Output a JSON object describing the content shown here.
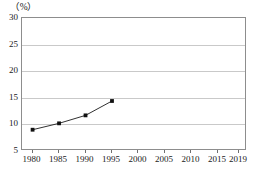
{
  "chart_data": {
    "type": "line",
    "title": "",
    "subtitle": "",
    "xlabel": "",
    "ylabel": "",
    "unit_label": "（%）",
    "x": [
      1980,
      1985,
      1990,
      1995
    ],
    "values": [
      9.0,
      10.2,
      11.7,
      14.4
    ],
    "series": [
      {
        "name": "",
        "x": [
          1980,
          1985,
          1990,
          1995
        ],
        "values": [
          9.0,
          10.2,
          11.7,
          14.4
        ],
        "marker": "square",
        "color": "#111111"
      }
    ],
    "xlim": [
      1978,
      2020.5
    ],
    "ylim": [
      5,
      30
    ],
    "y_ticks": [
      30,
      25,
      20,
      15,
      10,
      5
    ],
    "y_tick_labels": [
      "30",
      "25",
      "20",
      "15",
      "10",
      "5"
    ],
    "x_ticks": [
      1980,
      1985,
      1990,
      1995,
      2000,
      2005,
      2010,
      2015,
      2019
    ],
    "x_tick_labels": [
      "1980",
      "1985",
      "1990",
      "1995",
      "2000",
      "2005",
      "2010",
      "2015",
      "2019"
    ],
    "grid": true,
    "grid_axis": "y",
    "grid_color": "#c9c9c9",
    "frame_color": "#8d8d8d",
    "legend": false,
    "legend_position": "none",
    "annotations": []
  }
}
